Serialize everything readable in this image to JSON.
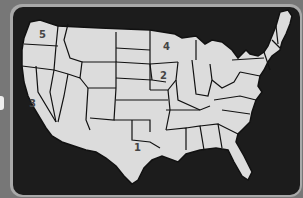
{
  "map": {
    "title": "United States regions",
    "labels": [
      {
        "id": "1",
        "text": "1",
        "region": "south-central"
      },
      {
        "id": "2",
        "text": "2",
        "region": "midwest"
      },
      {
        "id": "3",
        "text": "3",
        "region": "west-coast-south"
      },
      {
        "id": "4",
        "text": "4",
        "region": "upper-midwest"
      },
      {
        "id": "5",
        "text": "5",
        "region": "pacific-northwest"
      }
    ]
  },
  "colors": {
    "background": "#777777",
    "frame": "#a9a9a9",
    "panel": "#1c1c1c",
    "land": "#dcdcdc",
    "borders": "#111111"
  }
}
